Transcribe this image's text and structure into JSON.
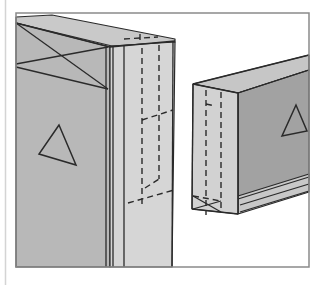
{
  "colors": {
    "background": "#ffffff",
    "frame": "#8a8a8a",
    "margin_line": "#d4d4d4",
    "ink": "#2a2a2a",
    "left_front_face": "#b8b8b8",
    "left_side_face": "#d6d6d6",
    "left_top_face": "#c9c9c9",
    "right_end_face": "#d2d2d2",
    "right_top_face": "#c6c6c6",
    "right_side_face": "#a2a2a2",
    "molding": "#c8c8c8"
  },
  "frame": {
    "x": 16,
    "y": 13,
    "width": 293,
    "height": 254
  },
  "margin_line": {
    "x": 5.5,
    "y1": 0,
    "y2": 285
  },
  "left_block": {
    "top_face": [
      [
        16,
        17
      ],
      [
        52,
        15
      ],
      [
        175,
        39
      ],
      [
        175,
        42
      ],
      [
        112,
        46
      ],
      [
        16,
        23
      ]
    ],
    "front_face": [
      [
        16,
        23
      ],
      [
        110,
        47
      ],
      [
        110,
        267
      ],
      [
        16,
        267
      ]
    ],
    "side_face": [
      [
        110,
        47
      ],
      [
        112,
        46
      ],
      [
        175,
        42
      ],
      [
        172,
        267
      ],
      [
        110,
        267
      ]
    ],
    "edges": [
      [
        [
          16,
          23
        ],
        [
          110,
          47
        ]
      ],
      [
        [
          110,
          47
        ],
        [
          175,
          41
        ]
      ],
      [
        [
          106,
          47
        ],
        [
          106,
          267
        ]
      ],
      [
        [
          113,
          47
        ],
        [
          113,
          267
        ]
      ],
      [
        [
          124,
          45
        ],
        [
          124,
          267
        ]
      ],
      [
        [
          173,
          41
        ],
        [
          172,
          267
        ]
      ]
    ],
    "x_mark": [
      [
        [
          16,
          23
        ],
        [
          108,
          89
        ]
      ],
      [
        [
          16,
          64
        ],
        [
          108,
          47
        ]
      ],
      [
        [
          16,
          67
        ],
        [
          108,
          89
        ]
      ]
    ],
    "hidden_lines": [
      [
        [
          142,
          48
        ],
        [
          142,
          207
        ]
      ],
      [
        [
          159,
          45
        ],
        [
          159,
          179
        ]
      ],
      [
        [
          128,
          203
        ],
        [
          174,
          190
        ]
      ],
      [
        [
          142,
          120
        ],
        [
          173,
          110
        ]
      ],
      [
        [
          145,
          188
        ],
        [
          159,
          179
        ]
      ],
      [
        [
          124,
          39
        ],
        [
          158,
          37
        ]
      ],
      [
        [
          140,
          34
        ],
        [
          140,
          42
        ]
      ]
    ],
    "triangle": [
      [
        59,
        125
      ],
      [
        39,
        154
      ],
      [
        76,
        165
      ]
    ]
  },
  "right_block": {
    "end_face": [
      [
        193,
        84
      ],
      [
        238,
        93
      ],
      [
        238,
        214
      ],
      [
        192,
        209
      ]
    ],
    "top_face": [
      [
        193,
        84
      ],
      [
        309,
        55
      ],
      [
        309,
        70
      ],
      [
        238,
        93
      ]
    ],
    "side_face": [
      [
        238,
        93
      ],
      [
        309,
        70
      ],
      [
        309,
        180
      ],
      [
        238,
        200
      ]
    ],
    "molding": [
      [
        238,
        196
      ],
      [
        309,
        174
      ],
      [
        309,
        192
      ],
      [
        238,
        214
      ]
    ],
    "edges": [
      [
        [
          193,
          84
        ],
        [
          309,
          55
        ]
      ],
      [
        [
          238,
          93
        ],
        [
          309,
          70
        ]
      ],
      [
        [
          193,
          84
        ],
        [
          238,
          93
        ]
      ],
      [
        [
          193,
          84
        ],
        [
          192,
          209
        ]
      ],
      [
        [
          238,
          93
        ],
        [
          238,
          214
        ]
      ],
      [
        [
          192,
          209
        ],
        [
          238,
          214
        ]
      ],
      [
        [
          238,
          199
        ],
        [
          309,
          177
        ]
      ],
      [
        [
          240,
          205
        ],
        [
          309,
          184
        ]
      ],
      [
        [
          240,
          212
        ],
        [
          309,
          191
        ]
      ]
    ],
    "hidden_lines": [
      [
        [
          206,
          90
        ],
        [
          206,
          215
        ]
      ],
      [
        [
          221,
          92
        ],
        [
          221,
          212
        ]
      ],
      [
        [
          206,
          104
        ],
        [
          215,
          106
        ]
      ],
      [
        [
          193,
          196
        ],
        [
          221,
          201
        ]
      ]
    ],
    "x_mark": [
      [
        [
          193,
          196
        ],
        [
          221,
          212
        ]
      ],
      [
        [
          193,
          209
        ],
        [
          221,
          201
        ]
      ]
    ],
    "triangle": [
      [
        296,
        105
      ],
      [
        282,
        136
      ],
      [
        307,
        131
      ]
    ]
  }
}
